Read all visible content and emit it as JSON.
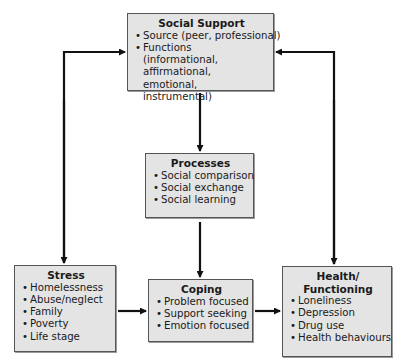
{
  "diagram": {
    "boxes": {
      "social_support": {
        "title": "Social Support",
        "items": [
          "Source (peer, professional)",
          "Functions (informational, affirmational, emotional, instrumental)"
        ]
      },
      "processes": {
        "title": "Processes",
        "items": [
          "Social comparison",
          "Social exchange",
          "Social learning"
        ]
      },
      "stress": {
        "title": "Stress",
        "items": [
          "Homelessness",
          "Abuse/neglect",
          "Family",
          "Poverty",
          "Life stage"
        ]
      },
      "coping": {
        "title": "Coping",
        "items": [
          "Problem focused",
          "Support seeking",
          "Emotion focused"
        ]
      },
      "health": {
        "title_line1": "Health/",
        "title_line2": "Functioning",
        "items": [
          "Loneliness",
          "Depression",
          "Drug use",
          "Health behaviours"
        ]
      }
    },
    "connections": [
      {
        "from": "stress",
        "to": "social_support",
        "bidirectional": true
      },
      {
        "from": "health",
        "to": "social_support",
        "bidirectional": true
      },
      {
        "from": "social_support",
        "to": "processes",
        "bidirectional": false
      },
      {
        "from": "processes",
        "to": "coping",
        "bidirectional": false
      },
      {
        "from": "stress",
        "to": "coping",
        "bidirectional": false
      },
      {
        "from": "coping",
        "to": "health",
        "bidirectional": false
      }
    ],
    "colors": {
      "box_fill": "#e4e4e4",
      "box_border": "#555555",
      "arrow": "#111111"
    }
  }
}
